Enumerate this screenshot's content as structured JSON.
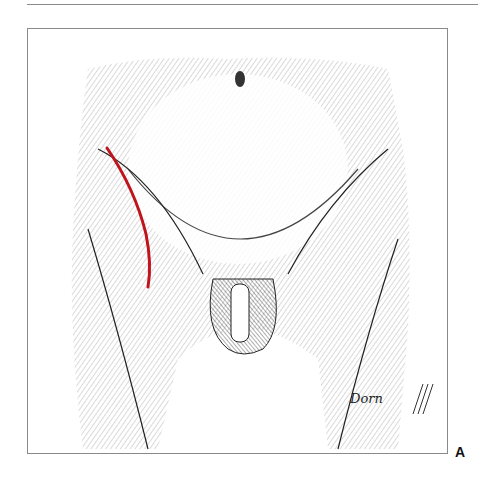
{
  "figure": {
    "panel_label": "A",
    "signature": "Dorn",
    "illustration": "pen-and-ink stipple drawing of lower abdomen and groin, anterior view",
    "incision_line_color": "#c0141c"
  }
}
